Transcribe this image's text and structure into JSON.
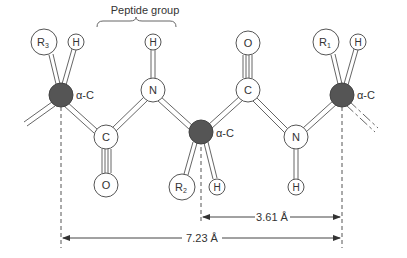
{
  "title": "Peptide group",
  "atoms": {
    "alpha_c_left": {
      "label": "α-C"
    },
    "r3": {
      "label": "R",
      "sub": "3"
    },
    "h_alpha_left": {
      "label": "H"
    },
    "c_left": {
      "label": "C"
    },
    "o_left": {
      "label": "O"
    },
    "n_top": {
      "label": "N"
    },
    "h_n_top": {
      "label": "H"
    },
    "alpha_c_mid": {
      "label": "α-C"
    },
    "r2": {
      "label": "R",
      "sub": "2"
    },
    "h_alpha_mid": {
      "label": "H"
    },
    "c_right": {
      "label": "C"
    },
    "o_right": {
      "label": "O"
    },
    "n_bottom": {
      "label": "N"
    },
    "h_n_bottom": {
      "label": "H"
    },
    "alpha_c_right": {
      "label": "α-C"
    },
    "r1": {
      "label": "R",
      "sub": "1"
    },
    "h_alpha_right": {
      "label": "H"
    }
  },
  "dimensions": {
    "short": "3.61 Å",
    "long": "7.23 Å"
  },
  "colors": {
    "alpha_carbon": "#555555",
    "atom_fill": "#ffffff",
    "line": "#555555"
  }
}
